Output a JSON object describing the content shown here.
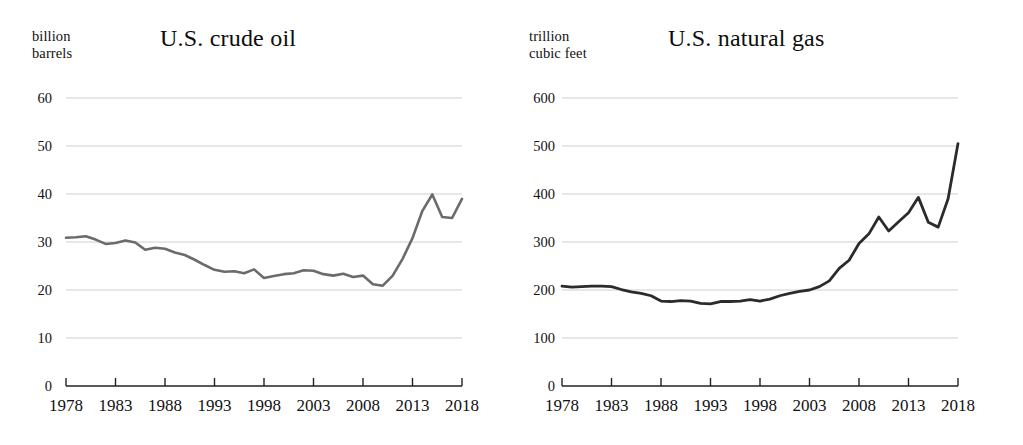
{
  "figure": {
    "background": "#ffffff",
    "line_color_oil": "#6b6b6b",
    "line_color_gas": "#2b2b2b",
    "grid_color": "#cfcfcf",
    "axis_color": "#222222"
  },
  "panels": [
    {
      "key": "crude_oil",
      "title": "U.S. crude oil",
      "unit_line1": "billion",
      "unit_line2": "barrels",
      "y_ticks": [
        "60",
        "50",
        "40",
        "30",
        "20",
        "10",
        "0"
      ],
      "x_ticks": [
        "1978",
        "1983",
        "1988",
        "1993",
        "1998",
        "2003",
        "2008",
        "2013",
        "2018"
      ]
    },
    {
      "key": "natural_gas",
      "title": "U.S. natural gas",
      "unit_line1": "trillion",
      "unit_line2": "cubic feet",
      "y_ticks": [
        "600",
        "500",
        "400",
        "300",
        "200",
        "100",
        "0"
      ],
      "x_ticks": [
        "1978",
        "1983",
        "1988",
        "1993",
        "1998",
        "2003",
        "2008",
        "2013",
        "2018"
      ]
    }
  ],
  "chart_data": [
    {
      "type": "line",
      "title": "U.S. crude oil",
      "xlabel": "",
      "ylabel": "billion barrels",
      "ylim": [
        0,
        60
      ],
      "xlim": [
        1978,
        2018
      ],
      "yticks": [
        0,
        10,
        20,
        30,
        40,
        50,
        60
      ],
      "xticks": [
        1978,
        1983,
        1988,
        1993,
        1998,
        2003,
        2008,
        2013,
        2018
      ],
      "grid": true,
      "legend": "none",
      "series": [
        {
          "name": "U.S. crude oil proved reserves",
          "units": "billion barrels",
          "x": [
            1978,
            1979,
            1980,
            1981,
            1982,
            1983,
            1984,
            1985,
            1986,
            1987,
            1988,
            1989,
            1990,
            1991,
            1992,
            1993,
            1994,
            1995,
            1996,
            1997,
            1998,
            1999,
            2000,
            2001,
            2002,
            2003,
            2004,
            2005,
            2006,
            2007,
            2008,
            2009,
            2010,
            2011,
            2012,
            2013,
            2014,
            2015,
            2016,
            2017,
            2018
          ],
          "values": [
            30.9,
            31.0,
            31.2,
            30.5,
            29.6,
            29.8,
            30.3,
            29.9,
            28.4,
            28.8,
            28.6,
            27.8,
            27.3,
            26.3,
            25.2,
            24.2,
            23.8,
            23.9,
            23.5,
            24.3,
            22.5,
            22.9,
            23.3,
            23.5,
            24.1,
            24.0,
            23.3,
            23.0,
            23.4,
            22.7,
            23.0,
            21.2,
            20.9,
            23.0,
            26.5,
            30.8,
            36.5,
            39.9,
            35.2,
            35.0,
            39.0,
            47.1
          ],
          "note": "Final 2018 point reaches approximately 47 billion barrels"
        }
      ]
    },
    {
      "type": "line",
      "title": "U.S. natural gas",
      "xlabel": "",
      "ylabel": "trillion cubic feet",
      "ylim": [
        0,
        600
      ],
      "xlim": [
        1978,
        2018
      ],
      "yticks": [
        0,
        100,
        200,
        300,
        400,
        500,
        600
      ],
      "xticks": [
        1978,
        1983,
        1988,
        1993,
        1998,
        2003,
        2008,
        2013,
        2018
      ],
      "grid": true,
      "legend": "none",
      "series": [
        {
          "name": "U.S. natural gas proved reserves",
          "units": "trillion cubic feet",
          "x": [
            1978,
            1979,
            1980,
            1981,
            1982,
            1983,
            1984,
            1985,
            1986,
            1987,
            1988,
            1989,
            1990,
            1991,
            1992,
            1993,
            1994,
            1995,
            1996,
            1997,
            1998,
            1999,
            2000,
            2001,
            2002,
            2003,
            2004,
            2005,
            2006,
            2007,
            2008,
            2009,
            2010,
            2011,
            2012,
            2013,
            2014,
            2015,
            2016,
            2017,
            2018
          ],
          "values": [
            208,
            206,
            207,
            208,
            208,
            207,
            201,
            196,
            193,
            188,
            177,
            176,
            178,
            177,
            172,
            171,
            176,
            176,
            177,
            180,
            177,
            181,
            188,
            193,
            197,
            200,
            207,
            219,
            245,
            262,
            297,
            317,
            352,
            323,
            342,
            361,
            393,
            341,
            331,
            390,
            505
          ],
          "note": "Final 2018 point reaches approximately 505 trillion cubic feet"
        }
      ]
    }
  ]
}
